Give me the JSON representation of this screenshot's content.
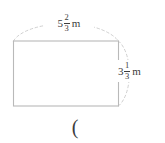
{
  "figure": {
    "type": "rectangle-with-dimension-labels",
    "shape": {
      "name": "rectangle",
      "stroke_color": "#b9b9b9",
      "fill_color": "#ffffff"
    },
    "arcs": {
      "stroke_color": "#c4c4c4",
      "style": "dashed",
      "top_arc_name": "width-dimension-arc",
      "right_arc_name": "height-dimension-arc"
    },
    "width_label": {
      "whole": "5",
      "numerator": "2",
      "denominator": "3",
      "unit": "m",
      "full_text": "5 2/3 m"
    },
    "height_label": {
      "whole": "3",
      "numerator": "1",
      "denominator": "3",
      "unit": "m",
      "full_text": "3 1/3 m"
    },
    "stray_text": "(",
    "text_color": "#3c3c3c",
    "background_color": "#ffffff"
  }
}
